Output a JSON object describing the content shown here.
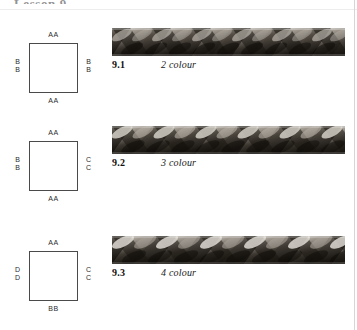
{
  "page": {
    "header_clipped": "Lesson 9",
    "background_color": "#ffffff",
    "rule_color": "#d6d6d6"
  },
  "figures": [
    {
      "id": "figure-9-1",
      "top": 28,
      "diagram": {
        "name": "braid-layout-square-9-1",
        "top_label": "AA",
        "bottom_label": "AA",
        "left_labels": [
          "B",
          "B"
        ],
        "right_labels": [
          "B",
          "B"
        ],
        "stroke_color": "#4a4a4a"
      },
      "braid": {
        "name": "braid-photo-9-1",
        "strand_count": 8,
        "repeat_px": 40,
        "base_color": "#2a2724",
        "light_color": "#d8d4cd",
        "mid_color": "#7a736a",
        "dark_color": "#16130f"
      },
      "caption": {
        "number": "9.1",
        "text": "2 colour"
      }
    },
    {
      "id": "figure-9-2",
      "top": 126,
      "diagram": {
        "name": "braid-layout-square-9-2",
        "top_label": "AA",
        "bottom_label": "AA",
        "left_labels": [
          "B",
          "B"
        ],
        "right_labels": [
          "C",
          "C"
        ],
        "stroke_color": "#4a4a4a"
      },
      "braid": {
        "name": "braid-photo-9-2",
        "strand_count": 8,
        "repeat_px": 42,
        "base_color": "#2b2825",
        "light_color": "#dedad3",
        "mid_color": "#7d7token",
        "dark_color": "#15120e"
      },
      "caption": {
        "number": "9.2",
        "text": "3 colour"
      }
    },
    {
      "id": "figure-9-3",
      "top": 236,
      "diagram": {
        "name": "braid-layout-square-9-3",
        "top_label": "AA",
        "bottom_label": "BB",
        "left_labels": [
          "D",
          "D"
        ],
        "right_labels": [
          "C",
          "C"
        ],
        "stroke_color": "#4a4a4a"
      },
      "braid": {
        "name": "braid-photo-9-3",
        "strand_count": 8,
        "repeat_px": 44,
        "base_color": "#2c2926",
        "light_color": "#e2ded7",
        "mid_color": "#827b72",
        "dark_color": "#141108"
      },
      "caption": {
        "number": "9.3",
        "text": "4 colour"
      }
    }
  ]
}
